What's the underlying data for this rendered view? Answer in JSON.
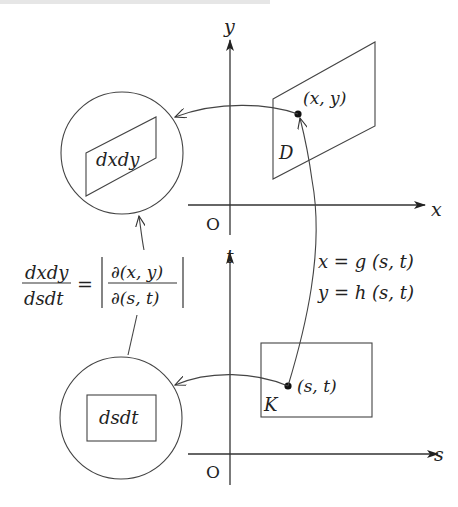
{
  "diagram": {
    "upper_plane": {
      "y_axis_label": "y",
      "x_axis_label": "x",
      "origin_label": "O",
      "region_label": "D",
      "point_label": "(x, y)"
    },
    "lower_plane": {
      "t_axis_label": "t",
      "s_axis_label": "s",
      "origin_label": "O",
      "region_label": "K",
      "point_label": "(s, t)"
    },
    "zoom_circles": {
      "upper_element_label": "dxdy",
      "lower_element_label": "dsdt"
    },
    "mapping": {
      "eq1": "x = g (s, t)",
      "eq2": "y = h (s, t)"
    },
    "jacobian_formula": {
      "lhs_numerator": "dxdy",
      "lhs_denominator": "dsdt",
      "equals": "=",
      "rhs_numerator": "∂(x, y)",
      "rhs_denominator": "∂(s, t)"
    },
    "colors": {
      "stroke": "#333333",
      "text": "#222222",
      "background": "#ffffff"
    }
  }
}
